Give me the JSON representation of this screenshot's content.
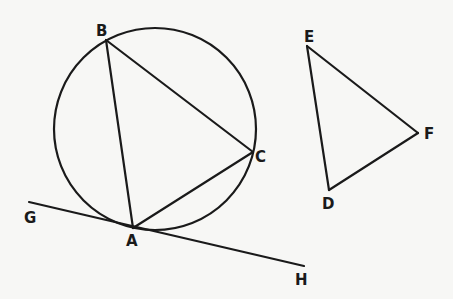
{
  "figure": {
    "circle": {
      "cx": 155,
      "cy": 129,
      "r": 101
    },
    "points": {
      "A": {
        "x": 133,
        "y": 228,
        "label": "A"
      },
      "B": {
        "x": 106,
        "y": 40,
        "label": "B"
      },
      "C": {
        "x": 253,
        "y": 152,
        "label": "C"
      },
      "D": {
        "x": 329,
        "y": 190,
        "label": "D"
      },
      "E": {
        "x": 307,
        "y": 46,
        "label": "E"
      },
      "F": {
        "x": 418,
        "y": 133,
        "label": "F"
      },
      "G": {
        "x": 29,
        "y": 202,
        "label": "G"
      },
      "H": {
        "x": 304,
        "y": 266,
        "label": "H"
      }
    },
    "segments": [
      [
        "A",
        "B"
      ],
      [
        "B",
        "C"
      ],
      [
        "C",
        "A"
      ],
      [
        "D",
        "E"
      ],
      [
        "E",
        "F"
      ],
      [
        "F",
        "D"
      ],
      [
        "G",
        "H"
      ]
    ],
    "colors": {
      "ink": "#1a1a1a",
      "paper": "#f7f7f5"
    }
  }
}
